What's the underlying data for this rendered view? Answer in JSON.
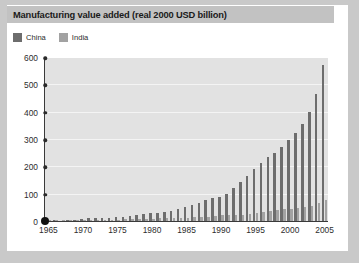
{
  "figure": {
    "title": "Manufacturing value added (real 2000 USD billion)",
    "frame_color": "#c9c9c9",
    "card_color": "#ffffff",
    "title_bar_color": "#c2c2c2",
    "plot_background": "#e2e2e2",
    "gridline_color": "#f4f4f4",
    "axis_color": "#3a3a3a"
  },
  "legend": {
    "position": "top-left",
    "entries": [
      {
        "label": "China",
        "color": "#6d6d6d",
        "swatch_icon": "square-swatch-icon"
      },
      {
        "label": "India",
        "color": "#a2a2a2",
        "swatch_icon": "square-swatch-icon"
      }
    ]
  },
  "chart_data": {
    "type": "bar",
    "title": "Manufacturing value added (real 2000 USD billion)",
    "xlabel": "",
    "ylabel": "",
    "ylim": [
      0,
      600
    ],
    "yticks": [
      0,
      100,
      200,
      300,
      400,
      500,
      600
    ],
    "ytick_labels": [
      "0",
      "100",
      "200",
      "300",
      "400",
      "500",
      "600"
    ],
    "xlim": [
      1965,
      2005
    ],
    "xticks": [
      1965,
      1970,
      1975,
      1980,
      1985,
      1990,
      1995,
      2000,
      2005
    ],
    "xtick_labels": [
      "1965",
      "1970",
      "1975",
      "1980",
      "1985",
      "1990",
      "1995",
      "2000",
      "2005"
    ],
    "grid": true,
    "grid_axis": "y",
    "legend_position": "top-left",
    "x": [
      1965,
      1966,
      1967,
      1968,
      1969,
      1970,
      1971,
      1972,
      1973,
      1974,
      1975,
      1976,
      1977,
      1978,
      1979,
      1980,
      1981,
      1982,
      1983,
      1984,
      1985,
      1986,
      1987,
      1988,
      1989,
      1990,
      1991,
      1992,
      1993,
      1994,
      1995,
      1996,
      1997,
      1998,
      1999,
      2000,
      2001,
      2002,
      2003,
      2004,
      2005
    ],
    "series": [
      {
        "name": "China",
        "color": "#6d6d6d",
        "values": [
          6,
          6,
          5,
          6,
          8,
          11,
          13,
          14,
          16,
          16,
          19,
          19,
          22,
          26,
          29,
          32,
          33,
          36,
          41,
          48,
          56,
          62,
          71,
          82,
          87,
          91,
          104,
          124,
          146,
          170,
          195,
          216,
          237,
          254,
          274,
          300,
          326,
          358,
          404,
          470,
          575
        ]
      },
      {
        "name": "India",
        "color": "#a2a2a2",
        "values": [
          6,
          6,
          6,
          6,
          7,
          8,
          8,
          8,
          9,
          9,
          9,
          10,
          11,
          12,
          11,
          12,
          13,
          13,
          14,
          15,
          16,
          17,
          18,
          20,
          22,
          24,
          24,
          26,
          27,
          30,
          34,
          38,
          41,
          43,
          46,
          49,
          52,
          55,
          60,
          68,
          79
        ]
      }
    ]
  }
}
